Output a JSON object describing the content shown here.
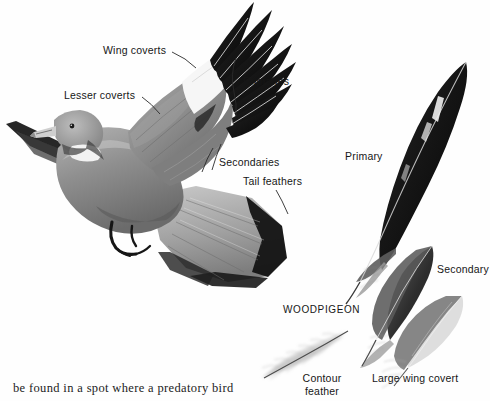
{
  "page": {
    "background_color": "#fefefe",
    "text_color": "#161616",
    "body_text": "be found in a spot where a predatory bird"
  },
  "illustration": {
    "subject_caption": "WOODPIGEON",
    "bird": {
      "name": "woodpigeon-in-flight",
      "description": "Grey woodpigeon in flight, wings raised, tail fanned"
    },
    "callouts": [
      {
        "id": "wing-coverts",
        "label": "Wing coverts",
        "x": 103,
        "y": 45,
        "leader": true
      },
      {
        "id": "lesser-coverts",
        "label": "Lesser coverts",
        "x": 64,
        "y": 90,
        "leader": true
      },
      {
        "id": "primaries",
        "label": "Primaries",
        "x": 243,
        "y": 76,
        "leader": true
      },
      {
        "id": "secondaries",
        "label": "Secondaries",
        "x": 219,
        "y": 157,
        "leader": true
      },
      {
        "id": "tail-feathers",
        "label": "Tail feathers",
        "x": 243,
        "y": 176,
        "leader": true
      }
    ],
    "feather_specimens": [
      {
        "id": "primary",
        "label": "Primary",
        "x": 345,
        "y": 151,
        "tone": "#171717"
      },
      {
        "id": "secondary",
        "label": "Secondary",
        "x": 437,
        "y": 264,
        "tone": "#3a3a3a"
      },
      {
        "id": "contour-feather",
        "label": "Contour\nfeather",
        "x": 296,
        "y": 373,
        "tone": "#b9b9b9"
      },
      {
        "id": "large-wing-covert",
        "label": "Large wing covert",
        "x": 372,
        "y": 373,
        "tone": "#8d8d8d"
      }
    ]
  },
  "colors": {
    "ink_black": "#0d0d0d",
    "feather_dark": "#1b1b1b",
    "feather_mid": "#6e6e6e",
    "feather_light": "#c8c8c8",
    "plumage_grey": "#9b9b9b",
    "plumage_shadow": "#5c5c5c",
    "paper": "#fefefe"
  }
}
